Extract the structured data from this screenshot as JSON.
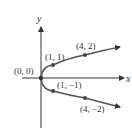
{
  "diagram": {
    "type": "parabola",
    "equation": "x = y^2",
    "axes": {
      "x_label": "x",
      "y_label": "y"
    },
    "points": [
      {
        "label": "(0, 0)",
        "x": 0,
        "y": 0
      },
      {
        "label": "(1, 1)",
        "x": 1,
        "y": 1
      },
      {
        "label": "(4, 2)",
        "x": 4,
        "y": 2
      },
      {
        "label": "(1, −1)",
        "x": 1,
        "y": -1
      },
      {
        "label": "(4, −2)",
        "x": 4,
        "y": -2
      }
    ],
    "colors": {
      "axis": "#333333",
      "curve": "#555555",
      "point": "#444444"
    }
  }
}
